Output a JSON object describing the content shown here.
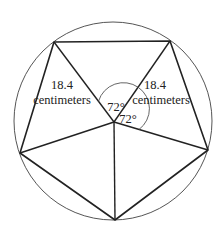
{
  "diagram": {
    "circle": {
      "cx": 113,
      "cy": 121,
      "r": 99
    },
    "center": {
      "x": 114,
      "y": 122
    },
    "vertices": [
      {
        "name": "top-left",
        "x": 54,
        "y": 42
      },
      {
        "name": "top-right",
        "x": 170,
        "y": 41
      },
      {
        "name": "right",
        "x": 208,
        "y": 150
      },
      {
        "name": "bottom",
        "x": 115,
        "y": 220
      },
      {
        "name": "left",
        "x": 20,
        "y": 153
      }
    ],
    "labels": {
      "left_radius_value": "18.4",
      "left_radius_unit": "centimeters",
      "right_radius_value": "18.4",
      "right_radius_unit": "centimeters",
      "angle_upper": "72°",
      "angle_lower": "72°"
    },
    "colors": {
      "stroke": "#222222",
      "circle": "#555555",
      "background": "#ffffff"
    }
  }
}
